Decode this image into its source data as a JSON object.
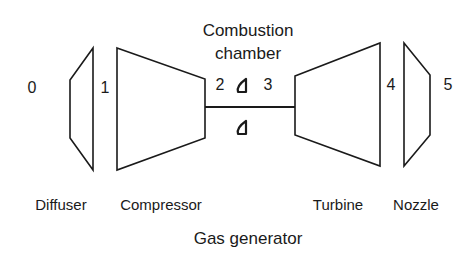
{
  "title": "Combustion chamber",
  "title_lines": [
    "Combustion",
    "chamber"
  ],
  "stations": [
    "0",
    "1",
    "2",
    "3",
    "4",
    "5"
  ],
  "components": {
    "diffuser": "Diffuser",
    "compressor": "Compressor",
    "turbine": "Turbine",
    "nozzle": "Nozzle"
  },
  "group_label": "Gas generator",
  "colors": {
    "stroke": "#1a1a1a",
    "background": "#ffffff"
  }
}
